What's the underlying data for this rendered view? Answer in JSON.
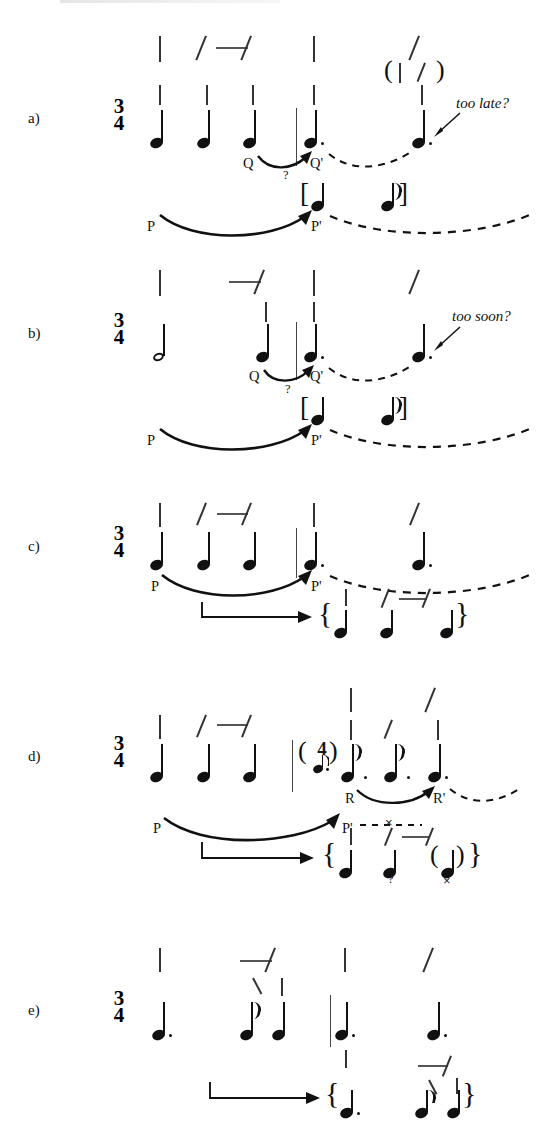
{
  "figure": {
    "type": "music-notation-analysis",
    "width": 550,
    "height": 1140,
    "ink_color": "#111111",
    "grid_color": "#333333"
  },
  "panels": [
    {
      "id": "a",
      "label": "a)",
      "time_signature": {
        "numerator": "3",
        "denominator": "4"
      },
      "notes": [
        {
          "type": "quarter",
          "dotted": false
        },
        {
          "type": "quarter",
          "dotted": false
        },
        {
          "type": "quarter",
          "dotted": false
        },
        {
          "type": "quarter",
          "dotted": true
        },
        {
          "type": "quarter",
          "dotted": true
        }
      ],
      "projections": [
        {
          "from": "Q",
          "to": "Q'",
          "style": "curved-arrow",
          "continuation": "dashed"
        },
        {
          "from": "P",
          "to": "P'",
          "style": "curved-arrow",
          "continuation": "dashed"
        }
      ],
      "question_mark": "?",
      "bracket": {
        "open": "[",
        "close": "]",
        "contents": [
          "quarter",
          "eighth"
        ]
      },
      "annotation": "too late?",
      "parenthesized_grid": "( | \\ )"
    },
    {
      "id": "b",
      "label": "b)",
      "time_signature": {
        "numerator": "3",
        "denominator": "4"
      },
      "notes": [
        {
          "type": "half",
          "dotted": false
        },
        {
          "type": "quarter",
          "dotted": false
        },
        {
          "type": "quarter",
          "dotted": true
        },
        {
          "type": "quarter",
          "dotted": true
        }
      ],
      "projections": [
        {
          "from": "Q",
          "to": "Q'",
          "style": "curved-arrow",
          "continuation": "dashed"
        },
        {
          "from": "P",
          "to": "P'",
          "style": "curved-arrow",
          "continuation": "dashed"
        }
      ],
      "question_mark": "?",
      "bracket": {
        "open": "[",
        "close": "]",
        "contents": [
          "quarter",
          "eighth"
        ]
      },
      "annotation": "too soon?"
    },
    {
      "id": "c",
      "label": "c)",
      "time_signature": {
        "numerator": "3",
        "denominator": "4"
      },
      "notes": [
        {
          "type": "quarter",
          "dotted": false
        },
        {
          "type": "quarter",
          "dotted": false
        },
        {
          "type": "quarter",
          "dotted": false
        },
        {
          "type": "quarter",
          "dotted": true
        },
        {
          "type": "quarter",
          "dotted": true
        }
      ],
      "projections": [
        {
          "from": "P",
          "to": "P'",
          "style": "curved-arrow",
          "continuation": "dashed"
        }
      ],
      "reinterpretation": {
        "arrow": "straight-hook-arrow",
        "brace": {
          "open": "{",
          "close": "}"
        },
        "notes": [
          {
            "type": "quarter",
            "dotted": false
          },
          {
            "type": "quarter",
            "dotted": false
          },
          {
            "type": "quarter",
            "dotted": false
          }
        ]
      }
    },
    {
      "id": "d",
      "label": "d)",
      "time_signature": {
        "numerator": "3",
        "denominator": "4"
      },
      "meter_change": {
        "numerator": "4",
        "denominator": "♪.",
        "parenthesized": true
      },
      "notes": [
        {
          "type": "quarter",
          "dotted": false
        },
        {
          "type": "quarter",
          "dotted": false
        },
        {
          "type": "quarter",
          "dotted": false
        },
        {
          "type": "eighth",
          "dotted": true
        },
        {
          "type": "eighth",
          "dotted": true
        },
        {
          "type": "quarter",
          "dotted": true
        }
      ],
      "projections": [
        {
          "from": "R",
          "to": "R'",
          "style": "curved-arrow",
          "continuation": "dashed"
        },
        {
          "from": "P",
          "to": "P'",
          "style": "curved-arrow",
          "continuation": "dashed-crossed"
        }
      ],
      "cancel_mark": "×",
      "reinterpretation": {
        "arrow": "straight-hook-arrow",
        "brace": {
          "open": "{",
          "close": "}"
        },
        "notes": [
          {
            "type": "quarter",
            "dotted": false,
            "mark": "?"
          },
          {
            "type": "quarter",
            "dotted": false
          },
          {
            "type": "quarter",
            "dotted": false,
            "parenthesized": true,
            "mark": "×"
          }
        ]
      },
      "question_mark": "?"
    },
    {
      "id": "e",
      "label": "e)",
      "time_signature": {
        "numerator": "3",
        "denominator": "4"
      },
      "notes": [
        {
          "type": "quarter",
          "dotted": true
        },
        {
          "type": "eighth",
          "dotted": false
        },
        {
          "type": "quarter",
          "dotted": false
        },
        {
          "type": "quarter",
          "dotted": true
        },
        {
          "type": "quarter",
          "dotted": true
        }
      ],
      "reinterpretation": {
        "arrow": "straight-hook-arrow",
        "brace": {
          "open": "{",
          "close": "}"
        },
        "notes": [
          {
            "type": "quarter",
            "dotted": true
          },
          {
            "type": "eighth",
            "dotted": false
          },
          {
            "type": "quarter",
            "dotted": false
          }
        ]
      }
    }
  ],
  "labels": {
    "P": "P",
    "Pprime": "P'",
    "Q": "Q",
    "Qprime": "Q'",
    "R": "R",
    "Rprime": "R'",
    "question": "?",
    "cross": "×",
    "bracket_open": "[",
    "bracket_close": "]",
    "brace_open": "{",
    "brace_close": "}",
    "paren_open": "(",
    "paren_close": ")"
  }
}
